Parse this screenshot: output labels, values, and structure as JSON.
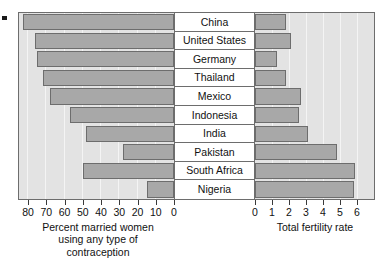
{
  "chart_data": {
    "type": "bar",
    "title": "",
    "orientation": "horizontal",
    "layout": "back-to-back pyramid with centered category labels",
    "categories": [
      "China",
      "United States",
      "Germany",
      "Thailand",
      "Mexico",
      "Indonesia",
      "India",
      "Pakistan",
      "South Africa",
      "Nigeria"
    ],
    "panels": [
      {
        "id": "left",
        "xlabel": "Percent married women using any type of contraception",
        "xlabel_lines": [
          "Percent married women",
          "using any type of",
          "contraception"
        ],
        "xlim": [
          0,
          85
        ],
        "axis_direction": "reversed",
        "ticks": [
          80,
          70,
          60,
          50,
          40,
          30,
          20,
          10,
          0
        ],
        "tick_labels": [
          "80",
          "70",
          "60",
          "50",
          "40",
          "30",
          "20",
          "10",
          "0"
        ],
        "grid": true,
        "values": [
          83,
          76,
          75,
          72,
          68,
          57,
          48,
          28,
          50,
          15
        ]
      },
      {
        "id": "right",
        "xlabel": "Total fertility rate",
        "xlabel_lines": [
          "Total fertility rate"
        ],
        "xlim": [
          0,
          7
        ],
        "axis_direction": "normal",
        "ticks": [
          0,
          1,
          2,
          3,
          4,
          5,
          6
        ],
        "tick_labels": [
          "0",
          "1",
          "2",
          "3",
          "4",
          "5",
          "6"
        ],
        "grid": true,
        "values": [
          1.8,
          2.1,
          1.3,
          1.8,
          2.7,
          2.6,
          3.1,
          4.8,
          5.9,
          5.8
        ]
      }
    ],
    "series": [
      {
        "name": "Percent married women using any type of contraception",
        "values": [
          83,
          76,
          75,
          72,
          68,
          57,
          48,
          28,
          50,
          15
        ]
      },
      {
        "name": "Total fertility rate",
        "values": [
          1.8,
          2.1,
          1.3,
          1.8,
          2.7,
          2.6,
          3.1,
          4.8,
          5.9,
          5.8
        ]
      }
    ],
    "colors": {
      "bar_fill": "#a8a8a8",
      "bar_stroke": "#6d6d6d",
      "plot_background": "#e3e3e3",
      "gridline": "#f4f4f4",
      "label_background": "#ffffff",
      "text": "#111111"
    },
    "legend": null,
    "annotations": []
  }
}
